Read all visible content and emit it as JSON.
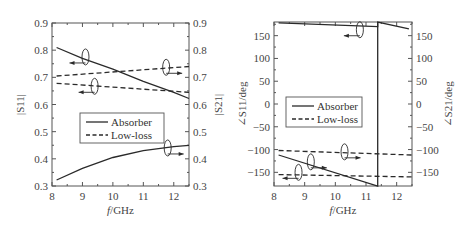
{
  "chart_data": [
    {
      "id": "magnitude",
      "type": "line",
      "title": "",
      "xlabel": "f/GHz",
      "ylabel_left": "|S11|",
      "ylabel_right": "|S21|",
      "xlim": [
        8,
        12.5
      ],
      "ylim": [
        0.3,
        0.9
      ],
      "x_ticks": [
        8,
        9,
        10,
        11,
        12
      ],
      "y_ticks": [
        0.3,
        0.4,
        0.5,
        0.6,
        0.7,
        0.8,
        0.9
      ],
      "y_tick_labels": [
        "0.3",
        "0.4",
        "0.5",
        "0.6",
        "0.7",
        "0.8",
        "0.9"
      ],
      "grid": false,
      "legend": {
        "position": "center-left",
        "entries": [
          "Absorber",
          "Low-loss"
        ]
      },
      "series": [
        {
          "name": "Absorber |S11|",
          "style": "solid",
          "axis": "left",
          "x": [
            8.15,
            9,
            10,
            11,
            12,
            12.5
          ],
          "y": [
            0.81,
            0.77,
            0.73,
            0.685,
            0.645,
            0.622
          ]
        },
        {
          "name": "Absorber |S21|",
          "style": "solid",
          "axis": "right",
          "x": [
            8.15,
            9,
            10,
            11,
            12,
            12.5
          ],
          "y": [
            0.322,
            0.365,
            0.405,
            0.43,
            0.445,
            0.45
          ]
        },
        {
          "name": "Low-loss |S21|",
          "style": "dashed",
          "axis": "right",
          "x": [
            8.15,
            12.5
          ],
          "y": [
            0.705,
            0.74
          ]
        },
        {
          "name": "Low-loss |S11|",
          "style": "dashed",
          "axis": "left",
          "x": [
            8.15,
            12.5
          ],
          "y": [
            0.678,
            0.645
          ]
        }
      ],
      "annotations": [
        {
          "type": "ellipse-arrow",
          "at": [
            9.1,
            0.775
          ],
          "direction": "left"
        },
        {
          "type": "ellipse-arrow",
          "at": [
            11.75,
            0.737
          ],
          "direction": "right"
        },
        {
          "type": "ellipse-arrow",
          "at": [
            9.4,
            0.667
          ],
          "direction": "left"
        },
        {
          "type": "ellipse-arrow",
          "at": [
            11.8,
            0.44
          ],
          "direction": "right"
        }
      ]
    },
    {
      "id": "phase",
      "type": "line",
      "title": "",
      "xlabel": "f/GHz",
      "ylabel_left": "∠S11/deg",
      "ylabel_right": "∠S21/deg",
      "xlim": [
        8,
        12.5
      ],
      "ylim": [
        -180,
        180
      ],
      "x_ticks": [
        8,
        9,
        10,
        11,
        12
      ],
      "y_ticks": [
        -150,
        -100,
        -50,
        0,
        50,
        100,
        150
      ],
      "y_tick_labels": [
        "−150",
        "−100",
        "−50",
        "0",
        "50",
        "100",
        "150"
      ],
      "grid": false,
      "legend": {
        "position": "center-left",
        "entries": [
          "Absorber",
          "Low-loss"
        ]
      },
      "series": [
        {
          "name": "Absorber ∠S11",
          "style": "solid",
          "axis": "left",
          "x": [
            8.15,
            11.38,
            11.38,
            12.4
          ],
          "y": [
            178,
            170,
            180,
            165
          ]
        },
        {
          "name": "Absorber ∠S21",
          "style": "solid",
          "axis": "right",
          "x": [
            8.15,
            11.38,
            11.38
          ],
          "y": [
            -112,
            -180,
            180
          ]
        },
        {
          "name": "Low-loss ∠S21",
          "style": "dashed",
          "axis": "right",
          "x": [
            8.15,
            12.5
          ],
          "y": [
            -102,
            -112
          ]
        },
        {
          "name": "Low-loss ∠S11",
          "style": "dashed",
          "axis": "left",
          "x": [
            8.15,
            12.5
          ],
          "y": [
            -155,
            -160
          ]
        }
      ],
      "annotations": [
        {
          "type": "ellipse-arrow",
          "at": [
            10.8,
            163
          ],
          "direction": "left"
        },
        {
          "type": "ellipse-arrow",
          "at": [
            10.3,
            -105
          ],
          "direction": "right"
        },
        {
          "type": "ellipse-arrow",
          "at": [
            9.2,
            -127
          ],
          "direction": "right"
        },
        {
          "type": "ellipse-arrow",
          "at": [
            8.8,
            -150
          ],
          "direction": "left"
        }
      ]
    }
  ],
  "legend": {
    "absorber": "Absorber",
    "lowloss": "Low-loss"
  },
  "labels": {
    "left": {
      "xlabel_f": "f",
      "xlabel_rest": "/GHz",
      "ylabel_left": "|S11|",
      "ylabel_right": "|S21|"
    },
    "right": {
      "xlabel_f": "f",
      "xlabel_rest": "/GHz",
      "ylabel_left": "∠S11/deg",
      "ylabel_right": "∠S21/deg"
    }
  },
  "colors": {
    "line": "#2a2a2a",
    "axis": "#555555"
  }
}
